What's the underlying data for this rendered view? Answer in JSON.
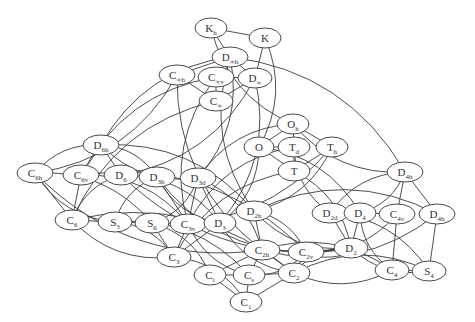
{
  "diagram": {
    "type": "graph",
    "colors": {
      "node_stroke": "#4a4a4a",
      "edge": "#3a3a3a",
      "text": "#333333",
      "background": "#ffffff"
    },
    "nodes": [
      {
        "id": "Kh",
        "base": "K",
        "sub": "h",
        "x": 211,
        "y": 28,
        "rx": 16
      },
      {
        "id": "K",
        "base": "K",
        "sub": "",
        "x": 265,
        "y": 38,
        "rx": 16
      },
      {
        "id": "Dinfh",
        "base": "D",
        "sub": "∞h",
        "x": 230,
        "y": 57,
        "rx": 18
      },
      {
        "id": "Cinfh",
        "base": "C",
        "sub": "∞h",
        "x": 177,
        "y": 75,
        "rx": 18
      },
      {
        "id": "Cinfv",
        "base": "C",
        "sub": "∞v",
        "x": 216,
        "y": 77,
        "rx": 18
      },
      {
        "id": "Dinf",
        "base": "D",
        "sub": "∞",
        "x": 255,
        "y": 78,
        "rx": 17
      },
      {
        "id": "Cinf",
        "base": "C",
        "sub": "∞",
        "x": 216,
        "y": 101,
        "rx": 17
      },
      {
        "id": "Oh",
        "base": "O",
        "sub": "h",
        "x": 293,
        "y": 124,
        "rx": 16
      },
      {
        "id": "O",
        "base": "O",
        "sub": "",
        "x": 259,
        "y": 147,
        "rx": 15
      },
      {
        "id": "Td",
        "base": "T",
        "sub": "d",
        "x": 294,
        "y": 147,
        "rx": 16
      },
      {
        "id": "Th",
        "base": "T",
        "sub": "h",
        "x": 332,
        "y": 147,
        "rx": 16
      },
      {
        "id": "T",
        "base": "T",
        "sub": "",
        "x": 294,
        "y": 171,
        "rx": 16
      },
      {
        "id": "D6h",
        "base": "D",
        "sub": "6h",
        "x": 101,
        "y": 145,
        "rx": 18
      },
      {
        "id": "C6h",
        "base": "C",
        "sub": "6h",
        "x": 35,
        "y": 173,
        "rx": 18
      },
      {
        "id": "C6v",
        "base": "C",
        "sub": "6v",
        "x": 81,
        "y": 175,
        "rx": 18
      },
      {
        "id": "D6",
        "base": "D",
        "sub": "6",
        "x": 121,
        "y": 175,
        "rx": 17
      },
      {
        "id": "D3h",
        "base": "D",
        "sub": "3h",
        "x": 157,
        "y": 177,
        "rx": 18
      },
      {
        "id": "D3d",
        "base": "D",
        "sub": "3d",
        "x": 198,
        "y": 178,
        "rx": 18
      },
      {
        "id": "D4h_top",
        "base": "D",
        "sub": "4h",
        "x": 405,
        "y": 172,
        "rx": 18
      },
      {
        "id": "C6",
        "base": "C",
        "sub": "6",
        "x": 72,
        "y": 220,
        "rx": 17
      },
      {
        "id": "S3",
        "base": "S",
        "sub": "3",
        "x": 115,
        "y": 222,
        "rx": 17
      },
      {
        "id": "S6",
        "base": "S",
        "sub": "6",
        "x": 152,
        "y": 223,
        "rx": 17
      },
      {
        "id": "C3v",
        "base": "C",
        "sub": "3v",
        "x": 188,
        "y": 224,
        "rx": 18
      },
      {
        "id": "D3",
        "base": "D",
        "sub": "3",
        "x": 220,
        "y": 223,
        "rx": 16
      },
      {
        "id": "D2h",
        "base": "D",
        "sub": "2h",
        "x": 254,
        "y": 211,
        "rx": 18
      },
      {
        "id": "D2d",
        "base": "D",
        "sub": "2d",
        "x": 330,
        "y": 213,
        "rx": 18
      },
      {
        "id": "D4",
        "base": "D",
        "sub": "4",
        "x": 360,
        "y": 213,
        "rx": 16
      },
      {
        "id": "C4v",
        "base": "C",
        "sub": "4v",
        "x": 397,
        "y": 214,
        "rx": 18
      },
      {
        "id": "D4h_right",
        "base": "D",
        "sub": "4h",
        "x": 437,
        "y": 214,
        "rx": 18
      },
      {
        "id": "C3",
        "base": "C",
        "sub": "3",
        "x": 174,
        "y": 257,
        "rx": 17
      },
      {
        "id": "C2h",
        "base": "C",
        "sub": "2h",
        "x": 262,
        "y": 250,
        "rx": 18
      },
      {
        "id": "C2v",
        "base": "C",
        "sub": "2v",
        "x": 306,
        "y": 252,
        "rx": 18
      },
      {
        "id": "D2",
        "base": "D",
        "sub": "2",
        "x": 351,
        "y": 248,
        "rx": 17
      },
      {
        "id": "C4",
        "base": "C",
        "sub": "4",
        "x": 392,
        "y": 270,
        "rx": 17
      },
      {
        "id": "S4",
        "base": "S",
        "sub": "4",
        "x": 429,
        "y": 271,
        "rx": 17
      },
      {
        "id": "Ci",
        "base": "C",
        "sub": "i",
        "x": 210,
        "y": 275,
        "rx": 16
      },
      {
        "id": "Cs",
        "base": "C",
        "sub": "s",
        "x": 249,
        "y": 275,
        "rx": 16
      },
      {
        "id": "C2",
        "base": "C",
        "sub": "2",
        "x": 294,
        "y": 273,
        "rx": 16
      },
      {
        "id": "C1",
        "base": "C",
        "sub": "1",
        "x": 246,
        "y": 302,
        "rx": 16
      }
    ],
    "edges": [
      [
        "Kh",
        "K"
      ],
      [
        "Kh",
        "Dinfh"
      ],
      [
        "K",
        "Dinf"
      ],
      [
        "Dinfh",
        "Cinfh"
      ],
      [
        "Dinfh",
        "Cinfv"
      ],
      [
        "Dinfh",
        "Dinf"
      ],
      [
        "Cinfh",
        "Cinf"
      ],
      [
        "Cinfv",
        "Cinf"
      ],
      [
        "Dinf",
        "Cinf"
      ],
      [
        "Cinfv",
        "Dinf"
      ],
      [
        "Oh",
        "O"
      ],
      [
        "Oh",
        "Td"
      ],
      [
        "Oh",
        "Th"
      ],
      [
        "O",
        "T"
      ],
      [
        "Td",
        "T"
      ],
      [
        "Th",
        "T"
      ],
      [
        "O",
        "Td"
      ],
      [
        "D6h",
        "C6h"
      ],
      [
        "D6h",
        "C6v"
      ],
      [
        "D6h",
        "D6"
      ],
      [
        "D6h",
        "D3h"
      ],
      [
        "D6h",
        "D3d"
      ],
      [
        "C6h",
        "C6"
      ],
      [
        "C6h",
        "S3"
      ],
      [
        "C6h",
        "S6"
      ],
      [
        "C6v",
        "C6"
      ],
      [
        "C6v",
        "C3v"
      ],
      [
        "D6",
        "C6"
      ],
      [
        "D6",
        "D3"
      ],
      [
        "D3h",
        "S3"
      ],
      [
        "D3h",
        "C3v"
      ],
      [
        "D3h",
        "D3"
      ],
      [
        "D3d",
        "S6"
      ],
      [
        "D3d",
        "C3v"
      ],
      [
        "D3d",
        "D3"
      ],
      [
        "C6",
        "S3"
      ],
      [
        "S3",
        "S6"
      ],
      [
        "S6",
        "C3v"
      ],
      [
        "C3v",
        "D3"
      ],
      [
        "C6",
        "C3"
      ],
      [
        "S3",
        "C3"
      ],
      [
        "S6",
        "C3"
      ],
      [
        "C3v",
        "C3"
      ],
      [
        "D3",
        "C3"
      ],
      [
        "D4h_top",
        "D4"
      ],
      [
        "D4h_top",
        "C4v"
      ],
      [
        "D4h_top",
        "D4h_right"
      ],
      [
        "D4h_top",
        "D2d"
      ],
      [
        "D2d",
        "D4"
      ],
      [
        "D4",
        "C4v"
      ],
      [
        "C4v",
        "C4"
      ],
      [
        "D4",
        "C4"
      ],
      [
        "D4h_right",
        "S4"
      ],
      [
        "C4",
        "S4"
      ],
      [
        "D2d",
        "S4"
      ],
      [
        "D2d",
        "D2"
      ],
      [
        "D4",
        "D2"
      ],
      [
        "D2h",
        "C2h"
      ],
      [
        "D2h",
        "C2v"
      ],
      [
        "D2h",
        "D2"
      ],
      [
        "C2h",
        "C2v"
      ],
      [
        "C2v",
        "D2"
      ],
      [
        "C2h",
        "Ci"
      ],
      [
        "C2h",
        "Cs"
      ],
      [
        "C2h",
        "C2"
      ],
      [
        "C2v",
        "C2"
      ],
      [
        "C2v",
        "Cs"
      ],
      [
        "D2",
        "C2"
      ],
      [
        "C3",
        "C1"
      ],
      [
        "Ci",
        "Cs"
      ],
      [
        "Cs",
        "C2"
      ],
      [
        "Ci",
        "C1"
      ],
      [
        "Cs",
        "C1"
      ],
      [
        "C2",
        "C1"
      ],
      [
        "C4",
        "C2"
      ],
      [
        "S4",
        "C2"
      ],
      [
        "T",
        "D2"
      ],
      [
        "Td",
        "D2d"
      ],
      [
        "Th",
        "D2h"
      ],
      [
        "Oh",
        "D4h_top"
      ],
      [
        "O",
        "D4"
      ],
      [
        "Oh",
        "D3d"
      ],
      [
        "O",
        "D3"
      ],
      [
        "Td",
        "C3v"
      ],
      [
        "Th",
        "S6"
      ],
      [
        "T",
        "C3"
      ],
      [
        "D6h",
        "D2h"
      ],
      [
        "C6h",
        "C2h"
      ],
      [
        "C6v",
        "C2v"
      ],
      [
        "D6",
        "D2"
      ],
      [
        "C6",
        "C2"
      ],
      [
        "D3h",
        "C2v"
      ],
      [
        "D3d",
        "C2h"
      ],
      [
        "D3",
        "C2"
      ],
      [
        "S6",
        "Ci"
      ],
      [
        "C3v",
        "Cs"
      ],
      [
        "S3",
        "Cs"
      ],
      [
        "Dinfh",
        "D6h"
      ],
      [
        "Dinfh",
        "D4h_top"
      ],
      [
        "Dinfh",
        "D2h"
      ],
      [
        "Cinfh",
        "C6h"
      ],
      [
        "Cinfv",
        "C6v"
      ],
      [
        "Dinf",
        "D6"
      ],
      [
        "Cinf",
        "C6"
      ],
      [
        "Dinfh",
        "D3d"
      ],
      [
        "Cinfv",
        "C3v"
      ],
      [
        "Dinf",
        "D3"
      ],
      [
        "Kh",
        "Oh"
      ],
      [
        "K",
        "O"
      ],
      [
        "Cinfh",
        "C2h"
      ],
      [
        "D4h_right",
        "C2h"
      ],
      [
        "D4h_right",
        "D2h"
      ],
      [
        "C4v",
        "C2v"
      ],
      [
        "C4",
        "C2h"
      ],
      [
        "S4",
        "D2"
      ]
    ]
  }
}
